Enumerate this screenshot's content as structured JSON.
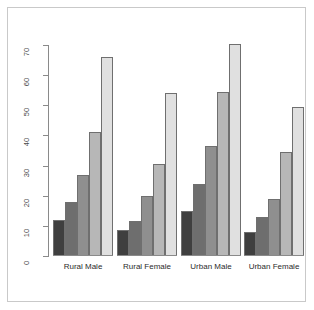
{
  "chart_data": {
    "type": "bar",
    "title": "",
    "xlabel": "",
    "ylabel": "",
    "ylim": [
      0,
      70
    ],
    "yticks": [
      0,
      10,
      20,
      30,
      40,
      50,
      60,
      70
    ],
    "grid": false,
    "legend": "none",
    "categories": [
      "Rural Male",
      "Rural Female",
      "Urban Male",
      "Urban Female"
    ],
    "series": [
      {
        "name": "series-1",
        "color": "#3f3f3f",
        "values": [
          12,
          8.5,
          15,
          8
        ]
      },
      {
        "name": "series-2",
        "color": "#6e6e6e",
        "values": [
          18,
          11.5,
          24,
          13
        ]
      },
      {
        "name": "series-3",
        "color": "#8f8f8f",
        "values": [
          27,
          20,
          36.5,
          19
        ]
      },
      {
        "name": "series-4",
        "color": "#b7b7b7",
        "values": [
          41,
          30.5,
          54.5,
          34.5
        ]
      },
      {
        "name": "series-5",
        "color": "#e0e0e0",
        "values": [
          66,
          54,
          70.5,
          49.5
        ]
      }
    ]
  },
  "axis": {
    "tick_labels": [
      "0",
      "10",
      "20",
      "30",
      "40",
      "50",
      "60",
      "70"
    ],
    "line_color": "#8a8a8a"
  },
  "frame": {
    "border_color": "#c9c9c9",
    "background": "#ffffff"
  }
}
